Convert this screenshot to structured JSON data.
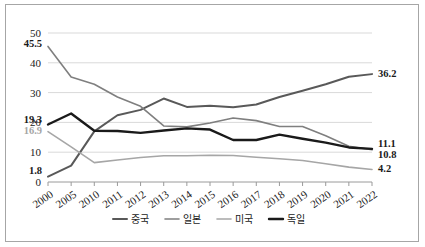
{
  "chart_data": {
    "type": "line",
    "title": "",
    "subtitle": "",
    "xlabel": "",
    "ylabel": "",
    "ylim": [
      0,
      50
    ],
    "yticks": [
      0,
      10,
      20,
      30,
      40,
      50
    ],
    "ytick_labels": [
      "0",
      "10",
      "20",
      "30",
      "40",
      "50"
    ],
    "grid": true,
    "legend_position": "bottom",
    "categories": [
      "2000",
      "2005",
      "2010",
      "2011",
      "2012",
      "2013",
      "2014",
      "2015",
      "2016",
      "2017",
      "2018",
      "2019",
      "2020",
      "2021",
      "2022"
    ],
    "series": [
      {
        "name": "중국",
        "color": "#595959",
        "width": 2.0,
        "values": [
          1.8,
          5.5,
          17.0,
          22.4,
          24.2,
          28.0,
          25.2,
          25.6,
          25.1,
          26.0,
          28.5,
          30.6,
          32.8,
          35.3,
          36.2
        ]
      },
      {
        "name": "일본",
        "color": "#7f7f7f",
        "width": 1.6,
        "values": [
          45.5,
          35.2,
          32.8,
          28.5,
          25.4,
          18.8,
          18.5,
          19.8,
          21.5,
          20.6,
          18.6,
          18.6,
          15.5,
          12.0,
          10.8
        ]
      },
      {
        "name": "미국",
        "color": "#a6a6a6",
        "width": 1.6,
        "values": [
          16.9,
          11.8,
          6.5,
          7.4,
          8.2,
          8.8,
          8.8,
          9.0,
          8.9,
          8.3,
          7.8,
          7.2,
          6.1,
          5.0,
          4.2
        ]
      },
      {
        "name": "독일",
        "color": "#1a1a1a",
        "width": 2.4,
        "values": [
          19.3,
          23.0,
          17.2,
          17.1,
          16.5,
          17.3,
          18.0,
          17.6,
          14.1,
          14.1,
          15.9,
          14.5,
          13.2,
          11.6,
          11.1
        ]
      }
    ],
    "annotations": [
      {
        "text": "45.5",
        "series": "일본",
        "x": "2000",
        "value": 45.5,
        "position": "left",
        "color": "#1a1a1a"
      },
      {
        "text": "19.3",
        "series": "독일",
        "x": "2000",
        "value": 19.3,
        "position": "left",
        "color": "#1a1a1a"
      },
      {
        "text": "16.9",
        "series": "미국",
        "x": "2000",
        "value": 16.9,
        "position": "left",
        "color": "#a6a6a6"
      },
      {
        "text": "1.8",
        "series": "중국",
        "x": "2000",
        "value": 1.8,
        "position": "left",
        "color": "#1a1a1a"
      },
      {
        "text": "36.2",
        "series": "중국",
        "x": "2022",
        "value": 36.2,
        "position": "right",
        "color": "#1a1a1a"
      },
      {
        "text": "11.1",
        "series": "독일",
        "x": "2022",
        "value": 11.1,
        "position": "right",
        "color": "#1a1a1a"
      },
      {
        "text": "10.8",
        "series": "일본",
        "x": "2022",
        "value": 10.8,
        "position": "right",
        "color": "#1a1a1a"
      },
      {
        "text": "4.2",
        "series": "미국",
        "x": "2022",
        "value": 4.2,
        "position": "right",
        "color": "#1a1a1a"
      }
    ]
  },
  "legend": {
    "items": [
      {
        "label": "중국",
        "color": "#595959"
      },
      {
        "label": "일본",
        "color": "#7f7f7f"
      },
      {
        "label": "미국",
        "color": "#a6a6a6"
      },
      {
        "label": "독일",
        "color": "#1a1a1a"
      }
    ]
  },
  "colors": {
    "border": "#a6a6a6",
    "gridline": "#d9d9d9",
    "axis": "#9a9a9a",
    "background": "#ffffff",
    "text": "#222222"
  }
}
